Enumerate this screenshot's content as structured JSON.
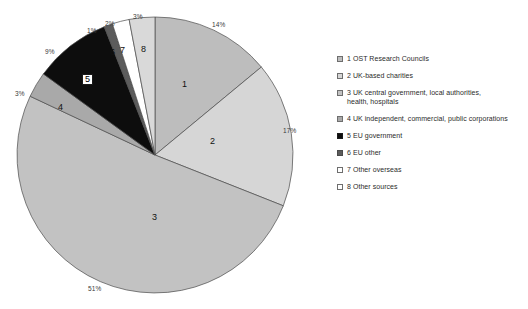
{
  "chart_data": {
    "type": "pie",
    "title": "",
    "xlabel": "",
    "ylabel": "",
    "legend_position": "right",
    "grid": false,
    "start_angle_deg": 0,
    "direction": "clockwise",
    "categories": [
      "1 OST Research Councils",
      "2 UK-based charities",
      "3 UK central government, local authorities, health, hospitals",
      "4 UK independent, commercial, public corporations",
      "5 EU  government",
      "6 EU  other",
      "7 Other overseas",
      "8 Other sources"
    ],
    "values": [
      14,
      17,
      51,
      3,
      9,
      1,
      2,
      3
    ],
    "value_labels": [
      "14%",
      "17%",
      "51%",
      "3%",
      "9%",
      "1%",
      "2%",
      "3%"
    ],
    "slice_numbers": [
      "1",
      "2",
      "3",
      "4",
      "5",
      "6",
      "7",
      "8"
    ],
    "colors": [
      "#bdbdbd",
      "#d6d6d6",
      "#c2c2c2",
      "#a9a9a9",
      "#0d0d0d",
      "#5c5c5c",
      "#ffffff",
      "#d9d9d9"
    ],
    "slice_edge_color": "#4a4a4a"
  },
  "pie": {
    "center_x": 155,
    "center_y": 155,
    "radius": 138,
    "pct_labels": [
      {
        "text": "14%",
        "x": 212,
        "y": 21
      },
      {
        "text": "17%",
        "x": 283,
        "y": 127
      },
      {
        "text": "51%",
        "x": 88,
        "y": 285
      },
      {
        "text": "3%",
        "x": 15,
        "y": 90
      },
      {
        "text": "9%",
        "x": 45,
        "y": 48
      },
      {
        "text": "1%",
        "x": 87,
        "y": 27
      },
      {
        "text": "2%",
        "x": 105,
        "y": 20
      },
      {
        "text": "3%",
        "x": 133,
        "y": 13
      }
    ],
    "slice_numbers": [
      {
        "text": "1",
        "x": 182,
        "y": 79,
        "boxed": false
      },
      {
        "text": "2",
        "x": 210,
        "y": 136,
        "boxed": false
      },
      {
        "text": "3",
        "x": 152,
        "y": 212,
        "boxed": false
      },
      {
        "text": "4",
        "x": 58,
        "y": 102,
        "boxed": false
      },
      {
        "text": "5",
        "x": 82,
        "y": 74,
        "boxed": true
      },
      {
        "text": "6",
        "x": 110,
        "y": 47,
        "boxed": false
      },
      {
        "text": "7",
        "x": 120,
        "y": 45,
        "boxed": false
      },
      {
        "text": "8",
        "x": 141,
        "y": 44,
        "boxed": false
      }
    ]
  },
  "legend": {
    "items": [
      {
        "label": "1 OST Research Councils",
        "color": "#bdbdbd",
        "border": "#6e6e6e"
      },
      {
        "label": "2 UK-based charities",
        "color": "#d6d6d6",
        "border": "#6e6e6e"
      },
      {
        "label": "3 UK central government, local authorities,\n    health, hospitals",
        "color": "#c2c2c2",
        "border": "#6e6e6e"
      },
      {
        "label": "4 UK independent, commercial, public corporations",
        "color": "#a9a9a9",
        "border": "#6e6e6e"
      },
      {
        "label": "5 EU  government",
        "color": "#0d0d0d",
        "border": "#1a1a1a"
      },
      {
        "label": "6 EU  other",
        "color": "#5c5c5c",
        "border": "#4a4a4a"
      },
      {
        "label": "7 Other overseas",
        "color": "#ffffff",
        "border": "#6e6e6e"
      },
      {
        "label": "8 Other sources",
        "color": "#ffffff",
        "border": "#6e6e6e"
      }
    ]
  }
}
